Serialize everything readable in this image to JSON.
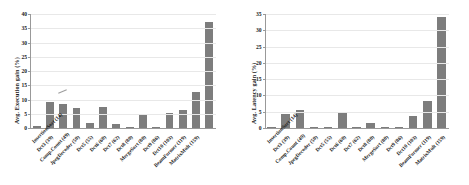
{
  "figure": {
    "background": "#ffffff",
    "bar_color": "#7d7d7d",
    "grid_color": "#e8e8e8"
  },
  "chart_data": [
    {
      "type": "bar",
      "title": "",
      "xlabel": "",
      "ylabel": "Avg. Execution gain (%)",
      "ylim": [
        0,
        40
      ],
      "yticks": [
        0,
        5,
        10,
        15,
        20,
        25,
        30,
        35,
        40
      ],
      "grid": true,
      "legend": "none",
      "categories": [
        "InsertionSort (14)",
        "Dct3 (39)",
        "Comp.Count (49)",
        "JpegDecoder (50)",
        "Dct5 (55)",
        "Dct6 (60)",
        "Dct7 (62)",
        "Dct8 (80)",
        "MergeSort (80)",
        "Dct9 (86)",
        "Dct10 (103)",
        "BeamFormer (119)",
        "MatrixMult (159)"
      ],
      "values": [
        0.6,
        9.0,
        8.4,
        6.9,
        1.6,
        7.3,
        1.4,
        0.5,
        4.6,
        0.4,
        5.1,
        6.4,
        12.6,
        37.3
      ]
    },
    {
      "type": "bar",
      "title": "",
      "xlabel": "",
      "ylabel": "Avg. Latency gain (%)",
      "ylim": [
        0,
        35
      ],
      "yticks": [
        0,
        5,
        10,
        15,
        20,
        25,
        30,
        35
      ],
      "grid": true,
      "legend": "none",
      "categories": [
        "InsertionSort (14)",
        "Dct3 (39)",
        "Comp.Count (49)",
        "JpegDecoder (50)",
        "Dct5 (55)",
        "Dct6 (60)",
        "Dct7 (62)",
        "Dct8 (80)",
        "MergeSort (80)",
        "Dct9 (86)",
        "Dct10 (103)",
        "BeamFormer (119)",
        "MatrixMult (159)"
      ],
      "values": [
        0.2,
        4.2,
        5.4,
        0.4,
        0.3,
        4.5,
        0.1,
        1.5,
        0.05,
        0.05,
        3.7,
        8.3,
        34.1
      ]
    }
  ]
}
